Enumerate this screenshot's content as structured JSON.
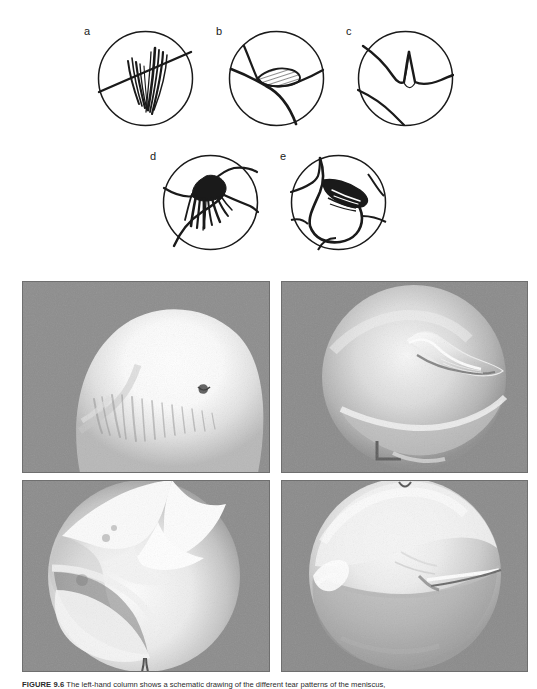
{
  "figure": {
    "number_label": "FIGURE 9.6",
    "caption_text": "The left-hand column shows a schematic drawing of the different tear patterns of the meniscus,",
    "caption_full": "FIGURE 9.6  The left-hand column shows a schematic drawing of the different tear patterns of the meniscus,",
    "caption_visible": "truncated at image bottom edge"
  },
  "diagram_panel": {
    "name": "schematic-meniscal-tear-patterns",
    "row1": [
      {
        "key": "a",
        "label": "a",
        "title": "radial / frayed vertical tear",
        "cx": 145,
        "cy": 78,
        "r": 48,
        "label_x": 84,
        "label_y": 30
      },
      {
        "key": "b",
        "label": "b",
        "title": "horizontal cleavage tear with hatched defect",
        "cx": 276,
        "cy": 78,
        "r": 48,
        "label_x": 216,
        "label_y": 30
      },
      {
        "key": "c",
        "label": "c",
        "title": "flap tear with sharp peak",
        "cx": 405,
        "cy": 78,
        "r": 48,
        "label_x": 346,
        "label_y": 30
      }
    ],
    "row2": [
      {
        "key": "d",
        "label": "d",
        "title": "degenerative frayed tear",
        "cx": 210,
        "cy": 202,
        "r": 48,
        "label_x": 150,
        "label_y": 155
      },
      {
        "key": "e",
        "label": "e",
        "title": "bucket-handle displaced tear",
        "cx": 338,
        "cy": 202,
        "r": 48,
        "label_x": 280,
        "label_y": 155
      }
    ]
  },
  "photo_panel": {
    "name": "arthroscopic-photograph-grid",
    "rows": 2,
    "cols": 2,
    "background_gray": "#8a8a8a",
    "photos": [
      {
        "position": "top-left",
        "description": "arthroscopic view of large bright femoral condyle with frayed meniscal fringe"
      },
      {
        "position": "top-right",
        "description": "arthroscopic circular field showing curved displaced meniscal flap"
      },
      {
        "position": "bottom-left",
        "description": "arthroscopic view of jagged white flap tear over condyle"
      },
      {
        "position": "bottom-right",
        "description": "arthroscopic view of smooth condyle with probe highlight"
      }
    ]
  },
  "colors": {
    "page_background": "#ffffff",
    "photo_background": "#8a8a8a",
    "ink": "#1a1a1a",
    "caption_ink": "#2a2a2a"
  }
}
